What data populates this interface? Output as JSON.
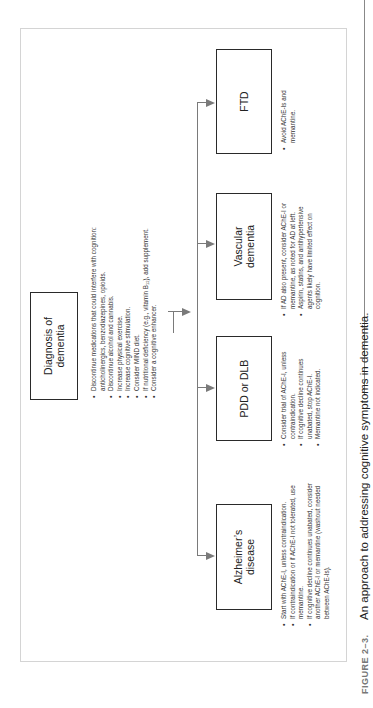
{
  "figure": {
    "label": "FIGURE 2–3.",
    "caption": "An approach to addressing cognitive symptoms in dementia."
  },
  "root": {
    "title_line1": "Diagnosis of",
    "title_line2": "dementia",
    "bullets": [
      "Discontinue medications that could interfere with cognition: anticholinergics, benzodiazepines, opioids.",
      "Discontinue alcohol and cannabis.",
      "Increase physical exercise.",
      "Increase cognitive stimulation.",
      "Consider MIND diet.",
      "If nutritional deficiency (e.g., vitamin B₁₂), add supplement.",
      "Consider a cognitive enhancer."
    ]
  },
  "branches": [
    {
      "title_line1": "Alzheimer’s",
      "title_line2": "disease",
      "bullets": [
        "Start with AChE-I, unless contraindication.",
        "If contraindication or if AChE-I not tolerated, use memantine.",
        "If cognitive decline continues unabated, consider another AChE-I or memantine (washout needed between AChE-Is)."
      ]
    },
    {
      "title_line1": "PDD or DLB",
      "title_line2": "",
      "bullets": [
        "Consider trial of AChE-I, unless contraindication.",
        "If cognitive decline continues unabated, stop AChE-I.",
        "Memantine not indicated."
      ]
    },
    {
      "title_line1": "Vascular",
      "title_line2": "dementia",
      "bullets": [
        "If AD also present, consider AChE-I or memantine, as noted for AD at left.",
        "Aspirin, statins, and antihypertensive agents likely have limited effect on cognition."
      ]
    },
    {
      "title_line1": "FTD",
      "title_line2": "",
      "bullets": [
        "Avoid AChE-Is and memantine."
      ]
    }
  ],
  "colors": {
    "connector": "#7a7a7a",
    "box_border": "#2a2a2a",
    "frame_border": "#d4d4d4",
    "caption_label": "#777777"
  }
}
